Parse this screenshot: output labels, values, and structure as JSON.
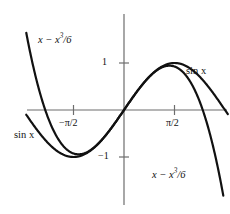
{
  "figure": {
    "background_color": "#ffffff",
    "curve_color": "#111111",
    "axis_color": "#6d6d6d"
  },
  "labels": {
    "taylor_top_left": {
      "base": "x − x",
      "exponent": "3",
      "suffix": "/6"
    },
    "taylor_bottom_right": {
      "base": "x − x",
      "exponent": "3",
      "suffix": "/6"
    },
    "sine_right": "sin x",
    "sine_left": "sin x"
  },
  "axes": {
    "x_ticks": [
      {
        "label": "−π/2",
        "value": -1.5708
      },
      {
        "label": "π/2",
        "value": 1.5708
      }
    ],
    "y_ticks": [
      {
        "label": "1",
        "value": 1
      },
      {
        "label": "−1",
        "value": -1
      }
    ],
    "xlim": [
      -2.55,
      2.85
    ],
    "ylim": [
      -2.05,
      1.75
    ],
    "grid": false
  },
  "chart_data": {
    "type": "line",
    "title": "",
    "subtitle": "",
    "xlabel": "",
    "ylabel": "",
    "xlim": [
      -2.55,
      2.85
    ],
    "ylim": [
      -2.05,
      1.75
    ],
    "grid": false,
    "legend_position": "inline-annotations",
    "x_tick_labels": [
      "−π/2",
      "π/2"
    ],
    "x_tick_values": [
      -1.5708,
      1.5708
    ],
    "y_tick_labels": [
      "1",
      "−1"
    ],
    "y_tick_values": [
      1,
      -1
    ],
    "annotations": [
      {
        "text": "x − x3/6",
        "x": -1.82,
        "y": 1.45
      },
      {
        "text": "x − x3/6",
        "x": 1.15,
        "y": -1.48
      },
      {
        "text": "sin x",
        "x": 1.95,
        "y": 0.78
      },
      {
        "text": "sin x",
        "x": -2.2,
        "y": -0.58
      }
    ],
    "series": [
      {
        "name": "sin x",
        "formula": "sin(x)",
        "x": [
          -2.4,
          -2.2,
          -2.0,
          -1.8,
          -1.5708,
          -1.4,
          -1.2,
          -1.0,
          -0.8,
          -0.6,
          -0.4,
          -0.2,
          0.0,
          0.2,
          0.4,
          0.6,
          0.8,
          1.0,
          1.2,
          1.4,
          1.5708,
          1.8,
          2.0,
          2.2,
          2.4,
          2.6,
          2.8
        ],
        "values": [
          -0.675,
          -0.808,
          -0.909,
          -0.974,
          -1.0,
          -0.985,
          -0.932,
          -0.841,
          -0.717,
          -0.565,
          -0.389,
          -0.199,
          0.0,
          0.199,
          0.389,
          0.565,
          0.717,
          0.841,
          0.932,
          0.985,
          1.0,
          0.974,
          0.909,
          0.808,
          0.675,
          0.516,
          0.335
        ]
      },
      {
        "name": "x − x3/6",
        "formula": "x - x^3/6",
        "x": [
          -2.4,
          -2.2,
          -2.0,
          -1.8,
          -1.5708,
          -1.4,
          -1.2,
          -1.0,
          -0.8,
          -0.6,
          -0.4,
          -0.2,
          0.0,
          0.2,
          0.4,
          0.6,
          0.8,
          1.0,
          1.2,
          1.4,
          1.5708,
          1.8,
          2.0,
          2.2,
          2.4,
          2.6,
          2.8
        ],
        "values": [
          -0.096,
          -0.425,
          -0.667,
          -0.828,
          -0.924,
          -0.943,
          -0.912,
          -0.833,
          -0.715,
          -0.564,
          -0.389,
          -0.199,
          0.0,
          0.199,
          0.389,
          0.564,
          0.715,
          0.833,
          0.912,
          0.943,
          0.924,
          0.828,
          0.667,
          0.425,
          0.096,
          -0.33,
          -0.859
        ]
      }
    ]
  }
}
